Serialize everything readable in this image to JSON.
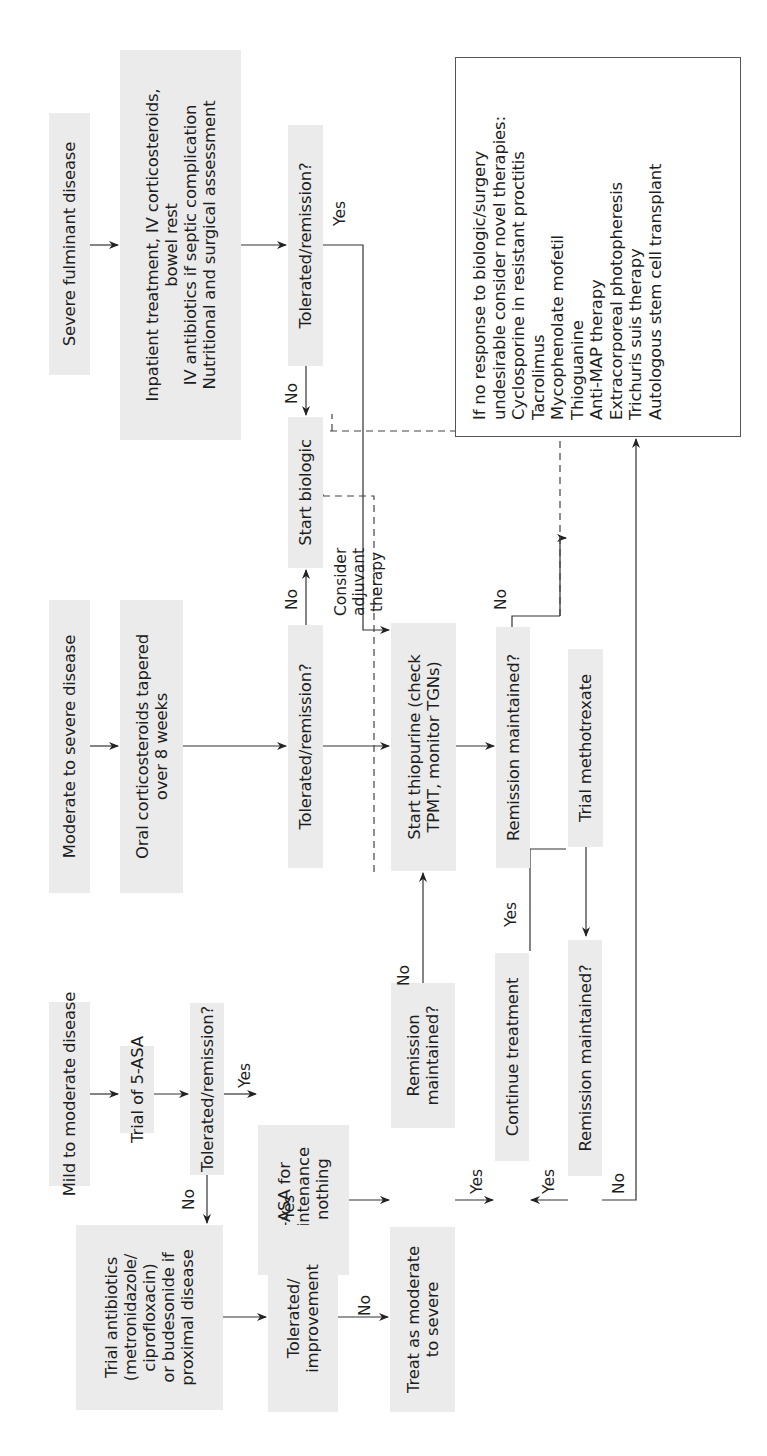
{
  "diagram": {
    "orientation": "rotated-90-ccw",
    "colors": {
      "box_fill": "#ebebeb",
      "line": "#333333",
      "note_border": "#555555",
      "background": "#ffffff"
    },
    "columns": {
      "mild": {
        "start": "Mild to moderate disease",
        "trial_5asa": "Trial of 5-ASA",
        "tolerated": "Tolerated/remission?",
        "maintenance": [
          "5-ASA for",
          "maintenance",
          "or nothing"
        ],
        "remission_maintained": [
          "Remission",
          "maintained?"
        ],
        "antibiotics": [
          "Trial antibiotics",
          "(metronidazole/",
          "ciprofloxacin)",
          "or budesonide if",
          "proximal disease"
        ],
        "tolerated_improvement": [
          "Tolerated/",
          "improvement"
        ],
        "treat_as_moderate": [
          "Treat as moderate",
          "to severe"
        ]
      },
      "moderate": {
        "start": "Moderate to severe disease",
        "oral_steroids": [
          "Oral corticosteroids tapered",
          "over 8 weeks"
        ],
        "tolerated": "Tolerated/remission?",
        "thiopurine": [
          "Start thiopurine (check",
          "TPMT, monitor TGNs)"
        ],
        "remission_maintained": "Remission maintained?",
        "methotrexate": "Trial methotrexate",
        "continue": "Continue treatment",
        "remission_maintained_2": "Remission maintained?"
      },
      "severe": {
        "start": "Severe fulminant disease",
        "inpatient": [
          "Inpatient treatment, IV corticosteroids,",
          "bowel rest",
          "IV antibiotics if septic complication",
          "Nutritional and surgical assessment"
        ],
        "tolerated": "Tolerated/remission?",
        "biologic": "Start biologic"
      }
    },
    "note_box": {
      "lines": [
        "If no response to biologic/surgery",
        "undesirable consider novel therapies:",
        "Cyclosporine in resistant proctitis",
        "Tacrolimus",
        "Mycophenolate mofetil",
        "Thioguanine",
        "Anti-MAP therapy",
        "Extracorporeal photopheresis",
        "Trichuris suis therapy",
        "Autologous stem cell transplant"
      ]
    },
    "edge_labels": {
      "yes": "Yes",
      "no": "No",
      "consider_adjuvant": [
        "Consider",
        "adjuvant",
        "therapy"
      ]
    }
  }
}
